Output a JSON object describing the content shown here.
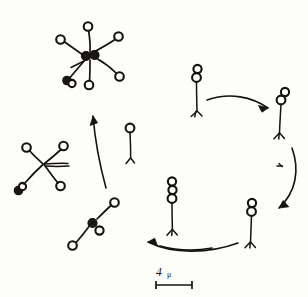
{
  "figure": {
    "title": "Life cycle diagram of a flagellated colonial protist",
    "background_color": "#fdfdfc",
    "ink_color": "#15120f"
  },
  "scale": {
    "value": "4",
    "unit": "μ",
    "full_label": "4 μ",
    "bar_length_px": 36,
    "position": "bottom-center"
  },
  "stages": [
    {
      "id": "stage-single-cell",
      "label": "single uniflagellate cell",
      "cell_count": 1,
      "position": "center-left of cycle",
      "x": 130,
      "y": 128
    },
    {
      "id": "stage-two-cell-top",
      "label": "two-celled stage",
      "cell_count": 2,
      "position": "top of cycle",
      "x": 197,
      "y": 85
    },
    {
      "id": "stage-two-cell-right",
      "label": "two-celled stage",
      "cell_count": 2,
      "position": "right of cycle",
      "x": 281,
      "y": 108
    },
    {
      "id": "stage-two-cell-bottom-right",
      "label": "two-celled stage",
      "cell_count": 2,
      "position": "bottom right of cycle",
      "x": 251,
      "y": 215
    },
    {
      "id": "stage-three-cell-bottom",
      "label": "three-celled stage",
      "cell_count": 3,
      "position": "bottom center of cycle",
      "x": 173,
      "y": 205
    },
    {
      "id": "stage-small-colony",
      "label": "young branching colony",
      "cell_count": 4,
      "position": "lower left",
      "x": 95,
      "y": 225
    },
    {
      "id": "stage-cross-colony",
      "label": "four-armed cross colony",
      "cell_count": 4,
      "position": "middle left",
      "x": 42,
      "y": 163
    },
    {
      "id": "stage-rosette-colony",
      "label": "mature rosette colony",
      "cell_count": 8,
      "position": "top left",
      "x": 90,
      "y": 52
    }
  ],
  "arrows": [
    {
      "id": "arrow-cycle-top",
      "from": "stage-single-cell",
      "to": "stage-two-cell-right",
      "direction": "right",
      "style": "curved"
    },
    {
      "id": "arrow-cycle-right",
      "from": "stage-two-cell-right",
      "to": "stage-two-cell-bottom-right",
      "direction": "down",
      "style": "curved"
    },
    {
      "id": "arrow-cycle-bottom",
      "from": "stage-three-cell-bottom",
      "to": "stage-small-colony",
      "direction": "left",
      "style": "curved"
    },
    {
      "id": "arrow-to-rosette",
      "from": "stage-small-colony",
      "to": "stage-rosette-colony",
      "direction": "up",
      "style": "curved"
    }
  ]
}
